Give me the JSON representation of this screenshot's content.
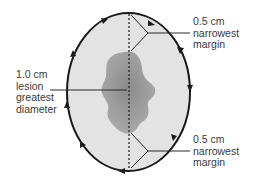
{
  "diagram": {
    "type": "surgical-excision-margin",
    "colors": {
      "background": "#ffffff",
      "ellipse_fill": "#e3e3e3",
      "ellipse_stroke": "#1a1a1a",
      "lesion_fill_center": "#8e8e8e",
      "lesion_fill_edge": "#a9a9a9",
      "leader_line": "#2a2a2a",
      "text": "#3a3a3a"
    },
    "labels": {
      "top_margin": [
        "0.5 cm",
        "narrowest",
        "margin"
      ],
      "lesion": [
        "1.0 cm",
        "lesion",
        "greatest",
        "diameter"
      ],
      "bottom_margin": [
        "0.5 cm",
        "narrowest",
        "margin"
      ]
    },
    "arrow_direction": "clockwise"
  }
}
